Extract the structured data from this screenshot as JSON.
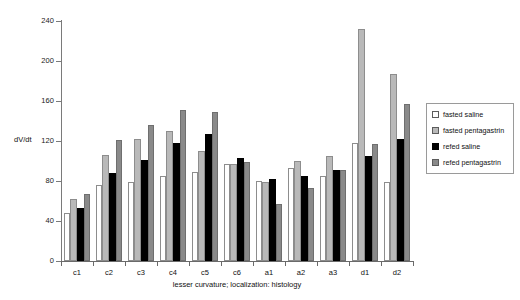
{
  "chart_data": {
    "type": "bar",
    "title": "",
    "subtitle": "",
    "xlabel": "lesser curvature; localization: histology",
    "ylabel": "dV/dt",
    "ylim": [
      0,
      240
    ],
    "yticks": [
      0,
      40,
      80,
      120,
      160,
      200,
      240
    ],
    "ytick_labels": [
      "0",
      "40",
      "80",
      "120",
      "160",
      "200",
      "240"
    ],
    "grid": false,
    "legend_position": "right",
    "categories": [
      "c1",
      "c2",
      "c3",
      "c4",
      "c5",
      "c6",
      "a1",
      "a2",
      "a3",
      "d1",
      "d2"
    ],
    "series": [
      {
        "name": "fasted saline",
        "color": "#ffffff",
        "values": [
          48,
          76,
          79,
          85,
          89,
          97,
          80,
          93,
          85,
          118,
          79
        ]
      },
      {
        "name": "fasted pentagastrin",
        "color": "#b9b9b9",
        "values": [
          62,
          106,
          122,
          130,
          110,
          97,
          79,
          100,
          105,
          232,
          187
        ]
      },
      {
        "name": "refed saline",
        "color": "#000000",
        "values": [
          53,
          88,
          101,
          118,
          127,
          103,
          82,
          85,
          91,
          105,
          122
        ]
      },
      {
        "name": "refed pentagastrin",
        "color": "#8a8a8a",
        "values": [
          67,
          121,
          136,
          151,
          149,
          99,
          57,
          73,
          91,
          117,
          157
        ]
      }
    ]
  },
  "legend": {
    "items": [
      {
        "label": "fasted saline",
        "swatch": "white-square-swatch"
      },
      {
        "label": "fasted pentagastrin",
        "swatch": "light-gray-square-swatch"
      },
      {
        "label": "refed saline",
        "swatch": "black-square-swatch"
      },
      {
        "label": "refed pentagastrin",
        "swatch": "medium-gray-square-swatch"
      }
    ]
  }
}
